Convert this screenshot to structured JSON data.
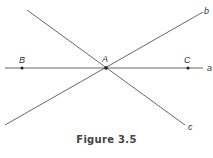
{
  "figure": {
    "caption": "Figure 3.5",
    "lines": [
      {
        "name": "a",
        "x1": 5,
        "y1": 68,
        "x2": 203,
        "y2": 68,
        "label_x": 207,
        "label_y": 71
      },
      {
        "name": "b",
        "x1": 5,
        "y1": 125,
        "x2": 203,
        "y2": 12,
        "label_x": 204,
        "label_y": 14
      },
      {
        "name": "c",
        "x1": 27,
        "y1": 10,
        "x2": 185,
        "y2": 125,
        "label_x": 188,
        "label_y": 130
      }
    ],
    "points": [
      {
        "name": "B",
        "x": 22,
        "y": 68,
        "label_x": 19,
        "label_y": 63
      },
      {
        "name": "A",
        "x": 106,
        "y": 68,
        "label_x": 102,
        "label_y": 62
      },
      {
        "name": "C",
        "x": 188,
        "y": 68,
        "label_x": 184,
        "label_y": 63
      }
    ],
    "stroke_color": "#555555",
    "point_color": "#222222"
  }
}
